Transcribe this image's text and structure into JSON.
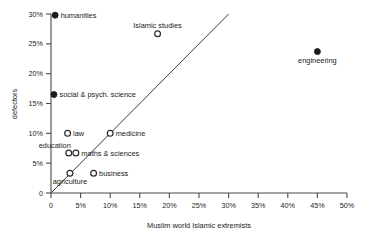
{
  "chart_data": {
    "type": "scatter",
    "title": "",
    "xlabel": "Muslim world Islamic extremists",
    "ylabel": "defectors",
    "xlim": [
      0,
      50
    ],
    "ylim": [
      0,
      30
    ],
    "grid": false,
    "legend": "none",
    "x_ticks": [
      "0",
      "5%",
      "10%",
      "15%",
      "20%",
      "25%",
      "30%",
      "35%",
      "40%",
      "45%",
      "50%"
    ],
    "x_tick_values": [
      0,
      5,
      10,
      15,
      20,
      25,
      30,
      35,
      40,
      45,
      50
    ],
    "y_ticks": [
      "0",
      "5%",
      "10%",
      "15%",
      "20%",
      "25%",
      "30%"
    ],
    "y_tick_values": [
      0,
      5,
      10,
      15,
      20,
      25,
      30
    ],
    "annotations": [
      {
        "label": "diagonal reference line",
        "type": "line",
        "from": [
          0,
          0
        ],
        "to": [
          30,
          30
        ]
      }
    ],
    "points": [
      {
        "name": "humanities",
        "x": 0.7,
        "y": 29.8,
        "marker": "filled",
        "label_pos": "right"
      },
      {
        "name": "Islamic studies",
        "x": 18.0,
        "y": 26.7,
        "marker": "open",
        "label_pos": "above"
      },
      {
        "name": "engineering",
        "x": 45.0,
        "y": 23.7,
        "marker": "filled",
        "label_pos": "below"
      },
      {
        "name": "social & psych. science",
        "x": 0.5,
        "y": 16.5,
        "marker": "filled",
        "label_pos": "right"
      },
      {
        "name": "law",
        "x": 2.8,
        "y": 10.0,
        "marker": "open",
        "label_pos": "right"
      },
      {
        "name": "medicine",
        "x": 10.0,
        "y": 10.0,
        "marker": "open",
        "label_pos": "right"
      },
      {
        "name": "education",
        "x": 3.0,
        "y": 6.7,
        "marker": "open",
        "label_pos": "above-left"
      },
      {
        "name": "maths & sciences",
        "x": 4.2,
        "y": 6.7,
        "marker": "open",
        "label_pos": "right"
      },
      {
        "name": "agriculture",
        "x": 3.2,
        "y": 3.3,
        "marker": "open",
        "label_pos": "below"
      },
      {
        "name": "business",
        "x": 7.2,
        "y": 3.3,
        "marker": "open",
        "label_pos": "right"
      }
    ]
  },
  "colors": {
    "axis": "#4a4a4a",
    "text": "#1a1a1a",
    "filled_marker": "#1c1c1c",
    "open_marker_stroke": "#2b2b2b",
    "reference_line": "#3a3a3a",
    "background": "#ffffff"
  }
}
